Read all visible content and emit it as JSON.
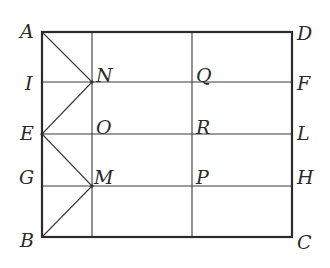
{
  "figure": {
    "type": "geometry-diagram",
    "stroke_color": "#2b2b2b",
    "background": "#ffffff",
    "points": {
      "A": {
        "label": "A"
      },
      "D": {
        "label": "D"
      },
      "I": {
        "label": "I"
      },
      "N": {
        "label": "N"
      },
      "Q": {
        "label": "Q"
      },
      "F": {
        "label": "F"
      },
      "E": {
        "label": "E"
      },
      "O": {
        "label": "O"
      },
      "R": {
        "label": "R"
      },
      "L": {
        "label": "L"
      },
      "G": {
        "label": "G"
      },
      "M": {
        "label": "M"
      },
      "P": {
        "label": "P"
      },
      "H": {
        "label": "H"
      },
      "B": {
        "label": "B"
      },
      "C": {
        "label": "C"
      }
    },
    "segments": [
      "AD",
      "BC",
      "AB",
      "DC",
      "IF",
      "EL",
      "GH",
      "NM-column",
      "QP-column",
      "AN",
      "NE",
      "EM",
      "MB"
    ]
  }
}
